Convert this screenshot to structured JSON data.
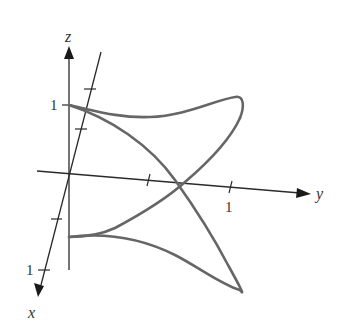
{
  "figure": {
    "axes": {
      "z": {
        "label": "z",
        "tick_label": "1"
      },
      "x": {
        "label": "x",
        "tick_label": "1"
      },
      "y": {
        "label": "y",
        "tick_label": "1"
      }
    },
    "colors": {
      "axis": "#2a2a2a",
      "curve": "#666666",
      "background": "#ffffff"
    }
  }
}
